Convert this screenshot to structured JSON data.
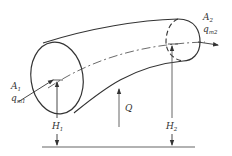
{
  "figure": {
    "type": "control-volume pipe flow diagram",
    "inlet": {
      "area_label": "A",
      "area_sub": "1",
      "flow_label": "q",
      "flow_sub": "m1"
    },
    "outlet": {
      "area_label": "A",
      "area_sub": "2",
      "flow_label": "q",
      "flow_sub": "m2"
    },
    "heat": {
      "label": "Q"
    },
    "heights": [
      {
        "label": "H",
        "sub": "1"
      },
      {
        "label": "H",
        "sub": "2"
      }
    ]
  },
  "colors": {
    "line": "#333333",
    "reference": "#555555",
    "background": "#ffffff"
  }
}
